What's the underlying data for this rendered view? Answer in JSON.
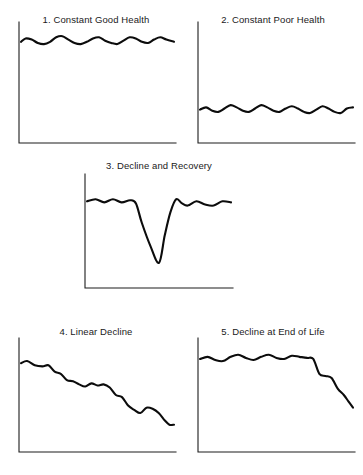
{
  "figure": {
    "background_color": "#ffffff",
    "line_color": "#0c0c0c",
    "axis_color": "#1d1d1d",
    "title_color": "#1a1a1a"
  },
  "panels": [
    {
      "id": "constant-good-health",
      "title": "1. Constant Good Health",
      "position": {
        "x": 8,
        "y": 14,
        "width": 176,
        "height": 134
      },
      "axes": {
        "origin_x": 11,
        "origin_y": 129,
        "x_end": 168,
        "y_top": 8
      }
    },
    {
      "id": "constant-poor-health",
      "title": "2. Constant Poor Health",
      "position": {
        "x": 187,
        "y": 14,
        "width": 172,
        "height": 134
      },
      "axes": {
        "origin_x": 11,
        "origin_y": 129,
        "x_end": 168,
        "y_top": 8
      }
    },
    {
      "id": "decline-and-recovery",
      "title": "3. Decline and Recovery",
      "position": {
        "x": 76,
        "y": 160,
        "width": 166,
        "height": 132
      },
      "axes": {
        "origin_x": 9,
        "origin_y": 128,
        "x_end": 157,
        "y_top": 14
      }
    },
    {
      "id": "linear-decline",
      "title": "4. Linear Decline",
      "position": {
        "x": 8,
        "y": 326,
        "width": 176,
        "height": 136
      },
      "axes": {
        "origin_x": 11,
        "origin_y": 126,
        "x_end": 168,
        "y_top": 12
      }
    },
    {
      "id": "decline-at-end-of-life",
      "title": "5. Decline at End of Life",
      "position": {
        "x": 187,
        "y": 326,
        "width": 172,
        "height": 136
      },
      "axes": {
        "origin_x": 11,
        "origin_y": 126,
        "x_end": 168,
        "y_top": 12
      }
    }
  ],
  "chart_data": [
    {
      "type": "line",
      "title": "1. Constant Good Health",
      "xlabel": "",
      "ylabel": "",
      "grid": false,
      "legend": false,
      "xlim": [
        0,
        100
      ],
      "ylim": [
        0,
        100
      ],
      "description": "Health remains high and stable across the whole time span, with small regular fluctuations.",
      "series": [
        {
          "name": "health",
          "x": [
            0,
            3,
            7,
            11,
            15,
            19,
            23,
            27,
            31,
            35,
            39,
            43,
            47,
            51,
            55,
            59,
            63,
            67,
            71,
            75,
            79,
            83,
            87,
            91,
            95,
            100
          ],
          "y": [
            86,
            89,
            88,
            85,
            84,
            86,
            90,
            91,
            88,
            85,
            84,
            86,
            89,
            90,
            87,
            85,
            84,
            87,
            90,
            89,
            86,
            85,
            88,
            90,
            88,
            86
          ]
        }
      ]
    },
    {
      "type": "line",
      "title": "2. Constant Poor Health",
      "xlabel": "",
      "ylabel": "",
      "grid": false,
      "legend": false,
      "xlim": [
        0,
        100
      ],
      "ylim": [
        0,
        100
      ],
      "description": "Health remains low and stable across the whole time span, with small regular fluctuations.",
      "series": [
        {
          "name": "health",
          "x": [
            0,
            4,
            8,
            12,
            16,
            20,
            24,
            28,
            32,
            36,
            40,
            44,
            48,
            52,
            56,
            60,
            64,
            68,
            72,
            76,
            80,
            84,
            88,
            92,
            96,
            100
          ],
          "y": [
            26,
            28,
            25,
            24,
            27,
            30,
            28,
            25,
            24,
            27,
            30,
            28,
            25,
            24,
            27,
            29,
            27,
            24,
            23,
            26,
            29,
            27,
            24,
            23,
            27,
            28
          ]
        }
      ]
    },
    {
      "type": "line",
      "title": "3. Decline and Recovery",
      "xlabel": "",
      "ylabel": "",
      "grid": false,
      "legend": false,
      "xlim": [
        0,
        100
      ],
      "ylim": [
        0,
        100
      ],
      "description": "Health is steady and high, then drops sharply to a deep trough before recovering back to the prior level.",
      "series": [
        {
          "name": "health",
          "x": [
            0,
            6,
            12,
            18,
            24,
            30,
            34,
            38,
            44,
            50,
            54,
            58,
            62,
            66,
            70,
            76,
            82,
            88,
            94,
            100
          ],
          "y": [
            78,
            80,
            77,
            80,
            77,
            79,
            76,
            58,
            36,
            20,
            46,
            68,
            80,
            76,
            74,
            78,
            75,
            74,
            78,
            77
          ]
        }
      ]
    },
    {
      "type": "line",
      "title": "4. Linear Decline",
      "xlabel": "",
      "ylabel": "",
      "grid": false,
      "legend": false,
      "xlim": [
        0,
        100
      ],
      "ylim": [
        0,
        100
      ],
      "description": "Health declines steadily in a stepped, downward staircase pattern from a high start to a low end.",
      "series": [
        {
          "name": "health",
          "x": [
            0,
            4,
            9,
            14,
            18,
            22,
            26,
            30,
            34,
            38,
            42,
            46,
            50,
            54,
            58,
            62,
            66,
            70,
            74,
            78,
            82,
            86,
            90,
            94,
            97,
            100
          ],
          "y": [
            80,
            82,
            78,
            77,
            78,
            72,
            70,
            64,
            63,
            60,
            58,
            61,
            59,
            60,
            57,
            50,
            48,
            40,
            36,
            33,
            38,
            37,
            33,
            26,
            22,
            22
          ]
        }
      ]
    },
    {
      "type": "line",
      "title": "5. Decline at End of Life",
      "xlabel": "",
      "ylabel": "",
      "grid": false,
      "legend": false,
      "xlim": [
        0,
        100
      ],
      "ylim": [
        0,
        100
      ],
      "description": "Health stays high and stable for most of the time span, then falls steeply in the final period.",
      "series": [
        {
          "name": "health",
          "x": [
            0,
            5,
            10,
            15,
            20,
            25,
            30,
            35,
            40,
            45,
            50,
            55,
            60,
            65,
            70,
            74,
            78,
            82,
            86,
            90,
            94,
            97,
            100
          ],
          "y": [
            84,
            86,
            83,
            82,
            86,
            88,
            85,
            83,
            86,
            88,
            85,
            84,
            87,
            86,
            85,
            84,
            70,
            68,
            66,
            56,
            50,
            44,
            38
          ]
        }
      ]
    }
  ]
}
